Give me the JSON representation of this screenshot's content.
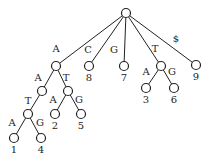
{
  "diagram": {
    "type": "suffix-tree",
    "nodes": [
      {
        "id": "root",
        "x": 126,
        "y": 13,
        "leaf": ""
      },
      {
        "id": "A",
        "x": 56,
        "y": 66,
        "leaf": ""
      },
      {
        "id": "C8",
        "x": 89,
        "y": 66,
        "leaf": "8"
      },
      {
        "id": "G7",
        "x": 124,
        "y": 66,
        "leaf": "7"
      },
      {
        "id": "T",
        "x": 161,
        "y": 66,
        "leaf": ""
      },
      {
        "id": "S9",
        "x": 196,
        "y": 65,
        "leaf": "9"
      },
      {
        "id": "AA",
        "x": 42,
        "y": 91,
        "leaf": ""
      },
      {
        "id": "AT",
        "x": 68,
        "y": 91,
        "leaf": ""
      },
      {
        "id": "AAT",
        "x": 28,
        "y": 114,
        "leaf": ""
      },
      {
        "id": "L2",
        "x": 55,
        "y": 114,
        "leaf": "2"
      },
      {
        "id": "L5",
        "x": 81,
        "y": 114,
        "leaf": "5"
      },
      {
        "id": "L1",
        "x": 14,
        "y": 138,
        "leaf": "1"
      },
      {
        "id": "L4",
        "x": 41,
        "y": 138,
        "leaf": "4"
      },
      {
        "id": "L3",
        "x": 146,
        "y": 88,
        "leaf": "3"
      },
      {
        "id": "L6",
        "x": 174,
        "y": 88,
        "leaf": "6"
      }
    ],
    "edges": [
      {
        "from": "root",
        "to": "A",
        "label": "A",
        "lx": 56,
        "ly": 52
      },
      {
        "from": "root",
        "to": "C8",
        "label": "C",
        "lx": 88,
        "ly": 53
      },
      {
        "from": "root",
        "to": "G7",
        "label": "G",
        "lx": 114,
        "ly": 53
      },
      {
        "from": "root",
        "to": "T",
        "label": "T",
        "lx": 155,
        "ly": 52
      },
      {
        "from": "root",
        "to": "S9",
        "label": "$",
        "lx": 176,
        "ly": 42
      },
      {
        "from": "A",
        "to": "AA",
        "label": "A",
        "lx": 38,
        "ly": 81
      },
      {
        "from": "A",
        "to": "AT",
        "label": "T",
        "lx": 66,
        "ly": 81
      },
      {
        "from": "AA",
        "to": "AAT",
        "label": "T",
        "lx": 28,
        "ly": 104
      },
      {
        "from": "AT",
        "to": "L2",
        "label": "A",
        "lx": 53,
        "ly": 103
      },
      {
        "from": "AT",
        "to": "L5",
        "label": "G",
        "lx": 79,
        "ly": 103
      },
      {
        "from": "AAT",
        "to": "L1",
        "label": "A",
        "lx": 12,
        "ly": 126
      },
      {
        "from": "AAT",
        "to": "L4",
        "label": "G",
        "lx": 40,
        "ly": 126
      },
      {
        "from": "T",
        "to": "L3",
        "label": "A",
        "lx": 146,
        "ly": 75
      },
      {
        "from": "T",
        "to": "L6",
        "label": "G",
        "lx": 172,
        "ly": 75
      }
    ]
  }
}
